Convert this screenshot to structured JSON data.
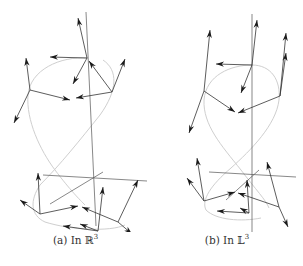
{
  "figure": {
    "panels": [
      {
        "id": "a",
        "caption_label": "(a) In ",
        "caption_space": "ℝ",
        "caption_exp": "3",
        "style": {
          "axis_color": "#555555",
          "curve_color": "#cfcfcf",
          "vector_color": "#1a1a1a"
        },
        "axes": [
          [
            86,
            12,
            96,
            226
          ],
          [
            43,
            175,
            147,
            181
          ],
          [
            50,
            204,
            103,
            172
          ]
        ],
        "curve_path": "M 88 58 C 60 56, 30 70, 28 95 C 26 120, 40 150, 55 170 C 70 190, 80 200, 85 205 M 103 60 C 118 70, 118 90, 100 115 C 80 140, 60 165, 40 185 C 30 200, 30 215, 45 222 C 70 230, 110 232, 125 225",
        "vectors": [
          [
            87,
            58,
            50,
            57
          ],
          [
            87,
            58,
            78,
            18
          ],
          [
            87,
            58,
            73,
            84
          ],
          [
            30,
            90,
            26,
            58
          ],
          [
            30,
            90,
            14,
            123
          ],
          [
            30,
            90,
            70,
            100
          ],
          [
            112,
            92,
            76,
            98
          ],
          [
            112,
            92,
            125,
            59
          ],
          [
            112,
            92,
            89,
            61
          ],
          [
            40,
            214,
            38,
            173
          ],
          [
            40,
            214,
            20,
            200
          ],
          [
            40,
            214,
            78,
            206
          ],
          [
            98,
            231,
            103,
            187
          ],
          [
            98,
            231,
            63,
            226
          ],
          [
            98,
            231,
            80,
            224
          ],
          [
            118,
            222,
            82,
            207
          ],
          [
            118,
            222,
            138,
            180
          ],
          [
            118,
            222,
            132,
            234
          ]
        ]
      },
      {
        "id": "b",
        "caption_label": "(b) In ",
        "caption_space": "𝕃",
        "caption_exp": "3",
        "style": {
          "axis_color": "#555555",
          "curve_color": "#cfcfcf",
          "vector_color": "#1a1a1a"
        },
        "axes": [
          [
            101,
            14,
            101,
            233
          ],
          [
            58,
            172,
            145,
            177
          ],
          [
            75,
            200,
            108,
            170
          ]
        ],
        "curve_path": "M 101 65 C 80 65, 55 75, 53 100 C 52 125, 70 145, 90 170 C 105 190, 115 200, 118 208 M 101 65 C 120 65, 130 80, 128 100 C 125 125, 100 150, 80 168 C 60 185, 50 200, 55 210 C 65 220, 90 222, 110 218",
        "vectors": [
          [
            101,
            65,
            106,
            20
          ],
          [
            101,
            65,
            65,
            64
          ],
          [
            101,
            65,
            90,
            93
          ],
          [
            53,
            91,
            59,
            30
          ],
          [
            53,
            91,
            38,
            133
          ],
          [
            53,
            91,
            84,
            112
          ],
          [
            129,
            96,
            135,
            53
          ],
          [
            129,
            96,
            135,
            33
          ],
          [
            129,
            96,
            87,
            113
          ],
          [
            53,
            201,
            46,
            158
          ],
          [
            53,
            201,
            36,
            178
          ],
          [
            53,
            201,
            84,
            192
          ],
          [
            98,
            213,
            96,
            180
          ],
          [
            98,
            213,
            66,
            211
          ],
          [
            98,
            213,
            89,
            208
          ],
          [
            128,
            207,
            87,
            193
          ],
          [
            128,
            207,
            116,
            162
          ],
          [
            128,
            207,
            137,
            227
          ]
        ]
      }
    ]
  }
}
